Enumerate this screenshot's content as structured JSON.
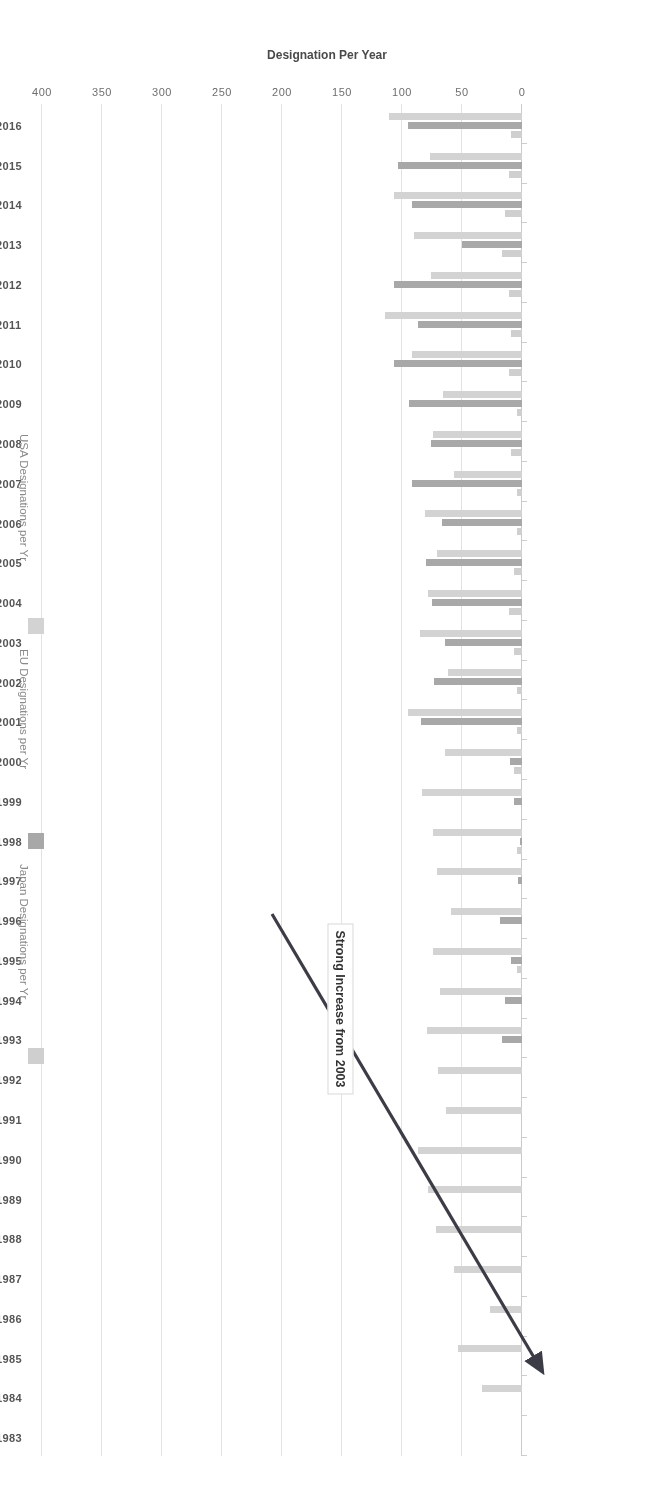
{
  "chart_data": {
    "type": "bar",
    "orientation": "horizontal",
    "title": "",
    "xlabel": "Designation Per Year",
    "ylabel": "",
    "xlim": [
      0,
      400
    ],
    "xticks": [
      "0",
      "50",
      "100",
      "150",
      "200",
      "250",
      "300",
      "350",
      "400"
    ],
    "grid": true,
    "legend_position": "right",
    "rotation_deg": 180,
    "categories": [
      "1983",
      "1984",
      "1985",
      "1986",
      "1987",
      "1988",
      "1989",
      "1990",
      "1991",
      "1992",
      "1993",
      "1994",
      "1995",
      "1996",
      "1997",
      "1998",
      "1999",
      "2000",
      "2001",
      "2002",
      "2003",
      "2004",
      "2005",
      "2006",
      "2007",
      "2008",
      "2009",
      "2010",
      "2011",
      "2012",
      "2013",
      "2014",
      "2015",
      "2016"
    ],
    "series": [
      {
        "name": "USA Designations per Yr",
        "color": "#d3d3d3",
        "values": [
          0,
          33,
          53,
          27,
          57,
          72,
          78,
          87,
          63,
          70,
          79,
          68,
          74,
          59,
          71,
          74,
          83,
          64,
          95,
          62,
          85,
          78,
          71,
          81,
          57,
          74,
          66,
          92,
          114,
          76,
          90,
          107,
          77,
          111
        ]
      },
      {
        "name": "EU Designations per Yr",
        "color": "#a8a8a8",
        "values": [
          0,
          0,
          0,
          0,
          0,
          0,
          0,
          0,
          0,
          0,
          17,
          14,
          9,
          18,
          3,
          2,
          7,
          10,
          84,
          73,
          64,
          75,
          80,
          67,
          92,
          76,
          94,
          107,
          87,
          107,
          50,
          92,
          103,
          95
        ]
      },
      {
        "name": "Japan Designations per Yr",
        "color": "#cfcfcf",
        "values": [
          0,
          0,
          0,
          0,
          0,
          0,
          0,
          0,
          0,
          0,
          0,
          0,
          4,
          0,
          0,
          4,
          0,
          7,
          4,
          4,
          7,
          11,
          7,
          4,
          4,
          9,
          4,
          11,
          9,
          11,
          17,
          14,
          11,
          9
        ]
      }
    ],
    "annotations": [
      {
        "text": "Strong Increase from 2003",
        "type": "callout-box-with-arrow",
        "points_to": "2015"
      }
    ]
  },
  "axis": {
    "value_axis_title": "Designation Per Year",
    "ticks": [
      "0",
      "50",
      "100",
      "150",
      "200",
      "250",
      "300",
      "350",
      "400"
    ]
  },
  "legend": {
    "items": [
      {
        "label": "USA Designations per Yr",
        "color": "#d3d3d3"
      },
      {
        "label": "EU Designations per Yr",
        "color": "#a8a8a8"
      },
      {
        "label": "Japan Designations per Yr",
        "color": "#cfcfcf"
      }
    ]
  },
  "annotation": {
    "label": "Strong Increase from 2003"
  }
}
